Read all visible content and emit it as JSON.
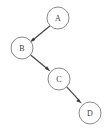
{
  "diagram": {
    "type": "directed-graph",
    "title": "",
    "canvas": {
      "width": 107,
      "height": 128,
      "background": "#ffffff"
    },
    "style": {
      "node_fill": "#ffffff",
      "node_stroke": "#8a8a8a",
      "node_radius": 11,
      "edge_color": "#4a4a4a",
      "label_color": "#3a3a3a"
    },
    "nodes": [
      {
        "id": "A",
        "label": "A",
        "cx": 58,
        "cy": 18,
        "r": 11
      },
      {
        "id": "B",
        "label": "B",
        "cx": 22,
        "cy": 48,
        "r": 11
      },
      {
        "id": "C",
        "label": "C",
        "cx": 59,
        "cy": 79,
        "r": 11
      },
      {
        "id": "D",
        "label": "D",
        "cx": 90,
        "cy": 113,
        "r": 11
      }
    ],
    "edges": [
      {
        "id": "A-B",
        "from": "A",
        "to": "B",
        "label": "",
        "directed": true
      },
      {
        "id": "B-C",
        "from": "B",
        "to": "C",
        "label": "",
        "directed": true
      },
      {
        "id": "C-D",
        "from": "C",
        "to": "D",
        "label": "",
        "directed": true
      }
    ]
  }
}
